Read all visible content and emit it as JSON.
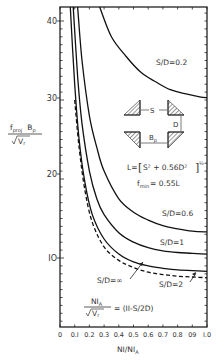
{
  "chart_data": {
    "type": "line",
    "title": "",
    "xlabel": "NI/NI_A",
    "ylabel": "f_proj B_p / sqrt(V_r)",
    "xlim": [
      0,
      1.0
    ],
    "ylim": [
      1.3,
      42
    ],
    "grid": false,
    "x_ticks": [
      "0",
      "0.1",
      "0.2",
      "0.3",
      "0.4",
      "0.5",
      "0.6",
      "0.7",
      "0.8",
      "0.9",
      "1.0"
    ],
    "x_tick_labels_display": [
      "0",
      "0.I",
      "0.2",
      "0.3",
      "0.4",
      "0.5",
      "0.6",
      "0.7",
      "0.8",
      "09",
      "I.0"
    ],
    "y_ticks": [
      10,
      20,
      30,
      40
    ],
    "y_tick_labels_display": [
      "IO",
      "20",
      "30",
      "40"
    ],
    "series": [
      {
        "name": "S/D=0.2",
        "style": "solid",
        "x": [
          0.27,
          0.35,
          0.45,
          0.55,
          0.65,
          0.75,
          0.85,
          0.95,
          1.0
        ],
        "y": [
          42,
          38,
          35.5,
          33.5,
          32.3,
          31.3,
          30.8,
          30.4,
          30.3
        ]
      },
      {
        "name": "S/D=0.6",
        "style": "solid",
        "x": [
          0.12,
          0.15,
          0.2,
          0.25,
          0.3,
          0.4,
          0.5,
          0.6,
          0.7,
          0.8,
          0.9,
          1.0
        ],
        "y": [
          42,
          35,
          28,
          24,
          21,
          17.5,
          15.8,
          14.8,
          14.1,
          13.7,
          13.4,
          13.3
        ]
      },
      {
        "name": "S/D=1",
        "style": "solid",
        "x": [
          0.09,
          0.12,
          0.15,
          0.2,
          0.25,
          0.3,
          0.4,
          0.5,
          0.6,
          0.7,
          0.8,
          0.9,
          1.0
        ],
        "y": [
          42,
          33,
          27,
          21,
          17.5,
          15.5,
          13.2,
          12.0,
          11.3,
          10.9,
          10.7,
          10.6,
          10.5
        ]
      },
      {
        "name": "S/D=2",
        "style": "solid",
        "x": [
          0.07,
          0.1,
          0.13,
          0.17,
          0.22,
          0.3,
          0.4,
          0.5,
          0.6,
          0.7,
          0.8,
          0.9,
          1.0
        ],
        "y": [
          42,
          32,
          25,
          19.5,
          15.5,
          12.4,
          10.5,
          9.5,
          9.0,
          8.7,
          8.5,
          8.4,
          8.3
        ]
      },
      {
        "name": "S/D=∞",
        "style": "dashed",
        "x": [
          0.1,
          0.13,
          0.17,
          0.22,
          0.3,
          0.4,
          0.5,
          0.6,
          0.7,
          0.8,
          0.9,
          1.0
        ],
        "y": [
          30,
          24,
          18.5,
          14.5,
          11.4,
          9.7,
          8.8,
          8.2,
          7.9,
          7.7,
          7.6,
          7.5
        ]
      }
    ],
    "annotations": [
      {
        "text": "S/D=0.2",
        "near_series": "S/D=0.2"
      },
      {
        "text": "S/D=0.6",
        "near_series": "S/D=0.6"
      },
      {
        "text": "S/D=1",
        "near_series": "S/D=1"
      },
      {
        "text": "S/D=2",
        "near_series": "S/D=2",
        "arrow": true
      },
      {
        "text": "S/D=∞",
        "near_series": "S/D=∞",
        "arrow": true
      },
      {
        "text": "L = [S² + 0.56D²]^½"
      },
      {
        "text": "f_min = 0.55L"
      },
      {
        "text": "NI_A / sqrt(V_r) = (11 - S/2D)"
      }
    ],
    "inset_diagram": {
      "labels": [
        "S",
        "D",
        "B_p"
      ],
      "description": "two pairs of hatched corner blocks separated by gap S horizontally and D vertically, width B_p"
    }
  },
  "labels": {
    "ylabel_num_f": "f",
    "ylabel_num_sub": "proj",
    "ylabel_num_b": "B",
    "ylabel_num_bsub": "p",
    "ylabel_den": "V",
    "ylabel_den_sub": "r",
    "xlabel_main": "NI/NI",
    "xlabel_sub": "A",
    "sd02": "S/D=0.2",
    "sd06": "S/D=0.6",
    "sd1": "S/D=1",
    "sd2": "S/D=2",
    "sdinf": "S/D=∞",
    "formula_L_prefix": "L=",
    "formula_L_body": "S² + 0.56D²",
    "formula_L_exp": "½",
    "fmin_f": "f",
    "fmin_sub": "min",
    "fmin_rest": "= 0.55L",
    "diag_s": "S",
    "diag_d": "D",
    "diag_b": "B",
    "diag_bsub": "p",
    "eq_num": "NI",
    "eq_num_sub": "A",
    "eq_den": "V",
    "eq_den_sub": "r",
    "eq_rhs": "= (II-S/2D)"
  },
  "ticks": {
    "y": [
      {
        "label": "40",
        "y": 21
      },
      {
        "label": "30",
        "y": 98
      },
      {
        "label": "20",
        "y": 174
      },
      {
        "label": "IO",
        "y": 258
      }
    ],
    "x": [
      "0",
      "0.I",
      "0.2",
      "0.3",
      "0.4",
      "0.5",
      "0.6",
      "0.7",
      "0.8",
      "09",
      "I.0"
    ]
  }
}
